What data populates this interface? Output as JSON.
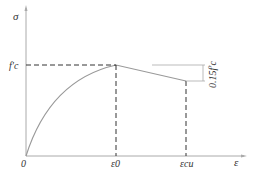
{
  "diagram": {
    "type": "stress-strain curve (concrete)",
    "y_axis_label": "σ",
    "x_axis_label": "ε",
    "origin_label": "0",
    "peak_stress_label": "f'c",
    "peak_strain_label": "ε0",
    "ultimate_strain_label": "εcu",
    "drop_label": "0.15f'c",
    "colors": {
      "curve": "#999999",
      "axes": "#aaaaaa",
      "dash": "#333333",
      "text": "#333333"
    }
  }
}
